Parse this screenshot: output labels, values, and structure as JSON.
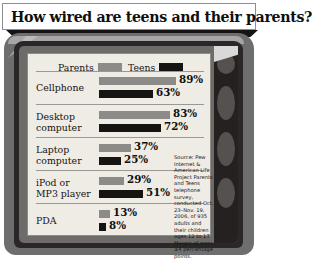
{
  "headline": "How wired are teens and their parents?",
  "legend": {
    "parents": {
      "label": "Parents",
      "color": "#8d8b88"
    },
    "teens": {
      "label": "Teens",
      "color": "#161413"
    }
  },
  "source_note": "Source: Pew Internet & American Life Project Parents and Teens telephone survey, conducted Oct. 23–Nov. 19, 2006, of 935 adults and their children ages 12 to 17 Margin of error ±4 percentage points.",
  "chart_data": {
    "type": "bar",
    "title": "How wired are teens and their parents?",
    "orientation": "horizontal",
    "xlabel": "",
    "ylabel": "",
    "xlim": [
      0,
      100
    ],
    "grid": false,
    "legend_position": "top",
    "categories": [
      "Cellphone",
      "Desktop computer",
      "Laptop computer",
      "iPod or MP3 player",
      "PDA"
    ],
    "series": [
      {
        "name": "Parents",
        "color": "#8d8b88",
        "values": [
          89,
          83,
          37,
          29,
          13
        ]
      },
      {
        "name": "Teens",
        "color": "#161413",
        "values": [
          63,
          72,
          25,
          51,
          8
        ]
      }
    ],
    "value_labels": {
      "parents": [
        "89%",
        "83%",
        "37%",
        "29%",
        "13%"
      ],
      "teens": [
        "63%",
        "72%",
        "25%",
        "51%",
        "8%"
      ]
    },
    "annotations": [
      "Source: Pew Internet & American Life Project Parents and Teens telephone survey, conducted Oct. 23–Nov. 19, 2006, of 935 adults and their children ages 12 to 17 Margin of error ±4 percentage points."
    ]
  },
  "rows": [
    {
      "label_line1": "Cellphone",
      "label_line2": "",
      "parents": "89%",
      "teens": "63%"
    },
    {
      "label_line1": "Desktop",
      "label_line2": "computer",
      "parents": "83%",
      "teens": "72%"
    },
    {
      "label_line1": "Laptop",
      "label_line2": "computer",
      "parents": "37%",
      "teens": "25%"
    },
    {
      "label_line1": "iPod or",
      "label_line2": "MP3 player",
      "parents": "29%",
      "teens": "51%"
    },
    {
      "label_line1": "PDA",
      "label_line2": "",
      "parents": "13%",
      "teens": "8%"
    }
  ]
}
